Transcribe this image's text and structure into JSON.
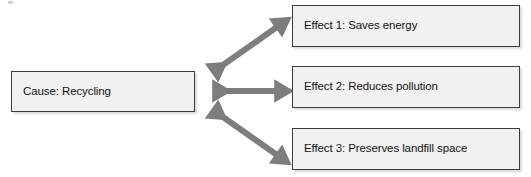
{
  "diagram": {
    "type": "cause-and-effect",
    "colors": {
      "box_fill": "#f1f1f1",
      "box_border": "#3d3d3d",
      "arrow": "#7d7d7d",
      "text": "#141414",
      "background": "#ffffff"
    },
    "cause": {
      "id": "cause",
      "label": "Cause: Recycling"
    },
    "effects": [
      {
        "id": "effect-1",
        "label": "Effect 1: Saves energy"
      },
      {
        "id": "effect-2",
        "label": "Effect 2: Reduces pollution"
      },
      {
        "id": "effect-3",
        "label": "Effect 3: Preserves landfill space"
      }
    ],
    "connectors": [
      {
        "id": "connector-1",
        "from": "cause",
        "to": "effect-1",
        "style": "double-headed-arrow",
        "direction": "diagonal-up-right"
      },
      {
        "id": "connector-2",
        "from": "cause",
        "to": "effect-2",
        "style": "double-headed-arrow",
        "direction": "horizontal"
      },
      {
        "id": "connector-3",
        "from": "cause",
        "to": "effect-3",
        "style": "double-headed-arrow",
        "direction": "diagonal-down-right"
      }
    ]
  }
}
